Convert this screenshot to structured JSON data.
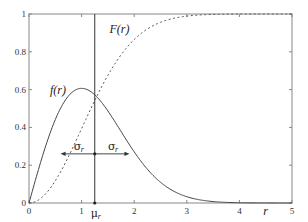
{
  "chart_data": {
    "type": "line",
    "title": "",
    "xlabel": "r",
    "ylabel": "",
    "xlim": [
      0,
      5
    ],
    "ylim": [
      0,
      1
    ],
    "grid": false,
    "x_ticks": [
      "0",
      "1",
      "2",
      "3",
      "4",
      "5"
    ],
    "y_ticks": [
      "0",
      "0.2",
      "0.4",
      "0.6",
      "0.8",
      "1"
    ],
    "series": [
      {
        "name": "f(r)",
        "style": "solid",
        "description": "Rayleigh probability density function (sigma = 1)",
        "x": [
          0,
          0.25,
          0.5,
          0.75,
          1.0,
          1.25,
          1.5,
          1.75,
          2.0,
          2.5,
          3.0,
          3.5,
          4.0,
          4.5,
          5.0
        ],
        "values": [
          0,
          0.242,
          0.441,
          0.566,
          0.607,
          0.572,
          0.487,
          0.379,
          0.271,
          0.11,
          0.033,
          0.008,
          0.001,
          0.0,
          0.0
        ]
      },
      {
        "name": "F(r)",
        "style": "dashed",
        "description": "Rayleigh cumulative distribution function (sigma = 1)",
        "x": [
          0,
          0.25,
          0.5,
          0.75,
          1.0,
          1.25,
          1.5,
          1.75,
          2.0,
          2.5,
          3.0,
          3.5,
          4.0,
          4.5,
          5.0
        ],
        "values": [
          0,
          0.031,
          0.118,
          0.245,
          0.393,
          0.542,
          0.675,
          0.784,
          0.865,
          0.956,
          0.989,
          0.998,
          1.0,
          1.0,
          1.0
        ]
      }
    ],
    "annotations": {
      "mean_line": {
        "label": "μ",
        "subscript": "r",
        "x": 1.25
      },
      "sigma_arrows": {
        "label": "σ",
        "subscript": "r",
        "y": 0.26,
        "left_x": 0.6,
        "right_x": 1.91
      },
      "curve_labels": [
        {
          "text": "f(r)",
          "x": 0.55,
          "y": 0.6
        },
        {
          "text": "F(r)",
          "x": 1.72,
          "y": 0.92
        }
      ]
    }
  }
}
